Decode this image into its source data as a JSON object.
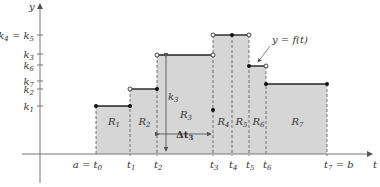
{
  "chart_data": {
    "type": "diagram",
    "curve_label": "y = f(t)",
    "axes": {
      "x_label": "t",
      "y_label": "y",
      "origin_px": [
        40,
        154
      ],
      "x_axis_px": [
        22,
        372
      ],
      "y_axis_top_px": 4,
      "y_axis_bottom_px": 183
    },
    "x_ticks": [
      {
        "label": "a = t",
        "sub": "0",
        "x": 96
      },
      {
        "label": "t",
        "sub": "1",
        "x": 130
      },
      {
        "label": "t",
        "sub": "2",
        "x": 157
      },
      {
        "label": "t",
        "sub": "3",
        "x": 213
      },
      {
        "label": "t",
        "sub": "4",
        "x": 232
      },
      {
        "label": "t",
        "sub": "5",
        "x": 249
      },
      {
        "label": "t",
        "sub": "6",
        "x": 266
      },
      {
        "label": "t",
        "sub": "7",
        "suffix": " = b",
        "x": 327
      }
    ],
    "y_ticks": [
      {
        "label": "k",
        "sub": "4",
        "extra": " = k",
        "extra_sub": "5",
        "y": 35
      },
      {
        "label": "k",
        "sub": "3",
        "y": 54
      },
      {
        "label": "k",
        "sub": "6",
        "y": 65
      },
      {
        "label": "k",
        "sub": "7",
        "y": 81
      },
      {
        "label": "k",
        "sub": "2",
        "y": 89
      },
      {
        "label": "k",
        "sub": "1",
        "y": 106
      }
    ],
    "rectangles": [
      {
        "name": "R",
        "sub": "1",
        "x0": 96,
        "x1": 130,
        "top": 106
      },
      {
        "name": "R",
        "sub": "2",
        "x0": 130,
        "x1": 157,
        "top": 89
      },
      {
        "name": "R",
        "sub": "3",
        "x0": 157,
        "x1": 213,
        "top": 55
      },
      {
        "name": "R",
        "sub": "4",
        "x0": 213,
        "x1": 232,
        "top": 35
      },
      {
        "name": "R",
        "sub": "5",
        "x0": 232,
        "x1": 249,
        "top": 35
      },
      {
        "name": "R",
        "sub": "6",
        "x0": 249,
        "x1": 266,
        "top": 66
      },
      {
        "name": "R",
        "sub": "7",
        "x0": 266,
        "x1": 327,
        "top": 84
      }
    ],
    "annotations": {
      "height_arrow": {
        "label": "k",
        "sub": "3",
        "x": 166,
        "y0": 55,
        "y1": 153
      },
      "width_arrow": {
        "label": "Δt",
        "sub": "3",
        "y": 134,
        "x0": 157,
        "x1": 213
      },
      "isolated_point": {
        "x": 213,
        "y": 110
      }
    },
    "endpoints": {
      "closed": [
        [
          96,
          106
        ],
        [
          130,
          106
        ],
        [
          157,
          89
        ],
        [
          232,
          35
        ],
        [
          249,
          66
        ],
        [
          266,
          84
        ],
        [
          327,
          84
        ],
        [
          213,
          110
        ]
      ],
      "open": [
        [
          130,
          89
        ],
        [
          157,
          55
        ],
        [
          213,
          55
        ],
        [
          213,
          35
        ],
        [
          249,
          35
        ],
        [
          266,
          66
        ]
      ]
    },
    "colors": {
      "fill": "#d6d6d6",
      "line": "#222222",
      "axis": "#777777"
    }
  }
}
